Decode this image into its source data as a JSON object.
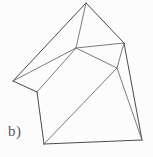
{
  "figure": {
    "label": "b)",
    "caption_text": "b)",
    "kind": "line-drawing",
    "canvas": {
      "width": 153,
      "height": 157
    },
    "colors": {
      "background": "#fcfcfc",
      "stroke": "#4a4a4a",
      "stroke_soft": "#6d6d6d",
      "label": "#5a5a5a"
    },
    "vertices": {
      "apex_top": [
        86,
        3
      ],
      "left_outer": [
        13,
        81
      ],
      "left_inner": [
        37,
        92
      ],
      "center_upper": [
        76,
        48
      ],
      "right_upper": [
        124,
        43
      ],
      "mid_right": [
        117,
        68
      ],
      "bottom_left": [
        44,
        144
      ],
      "bottom_right": [
        142,
        140
      ]
    },
    "edges": [
      {
        "from": "apex_top",
        "to": "left_outer"
      },
      {
        "from": "apex_top",
        "to": "center_upper"
      },
      {
        "from": "apex_top",
        "to": "right_upper"
      },
      {
        "from": "left_outer",
        "to": "left_inner"
      },
      {
        "from": "left_outer",
        "to": "center_upper"
      },
      {
        "from": "left_inner",
        "to": "center_upper"
      },
      {
        "from": "left_inner",
        "to": "bottom_left"
      },
      {
        "from": "center_upper",
        "to": "right_upper"
      },
      {
        "from": "center_upper",
        "to": "mid_right"
      },
      {
        "from": "right_upper",
        "to": "mid_right"
      },
      {
        "from": "right_upper",
        "to": "bottom_right"
      },
      {
        "from": "mid_right",
        "to": "bottom_right"
      },
      {
        "from": "mid_right",
        "to": "bottom_left"
      },
      {
        "from": "bottom_left",
        "to": "bottom_right"
      }
    ]
  }
}
